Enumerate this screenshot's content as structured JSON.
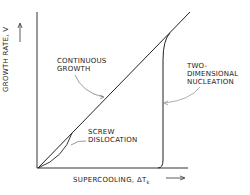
{
  "figure": {
    "y_axis_label": "GROWTH RATE, V",
    "x_axis_label": "SUPERCOOLING, ΔT",
    "x_axis_subscript": "k",
    "curves": [
      {
        "name": "continuous-growth",
        "label": [
          "CONTINUOUS",
          "GROWTH"
        ]
      },
      {
        "name": "screw-dislocation",
        "label": [
          "SCREW",
          "DISLOCATION"
        ]
      },
      {
        "name": "two-dimensional-nucleation",
        "label": [
          "TWO-",
          "DIMENSIONAL",
          "NUCLEATION"
        ]
      }
    ],
    "colors": {
      "line": "#222222",
      "background": "#ffffff"
    }
  }
}
